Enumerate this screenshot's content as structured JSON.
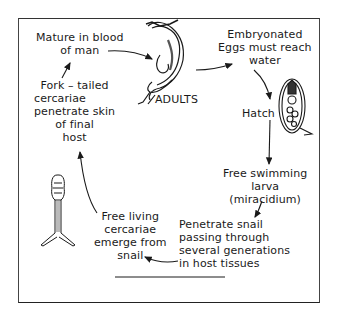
{
  "diagram": {
    "type": "life-cycle",
    "stages": [
      {
        "id": "adults",
        "label": [
          "ADULTS"
        ]
      },
      {
        "id": "mature",
        "label": [
          "Mature in blood",
          "of man"
        ]
      },
      {
        "id": "eggs",
        "label": [
          "Embryonated",
          "Eggs must reach",
          "water"
        ]
      },
      {
        "id": "hatch",
        "label": [
          "Hatch"
        ]
      },
      {
        "id": "miracidium",
        "label": [
          "Free swimming",
          "larva",
          "(miracidium)"
        ]
      },
      {
        "id": "snail",
        "label": [
          "Penetrate snail",
          "passing through",
          "several generations",
          "in host tissues"
        ]
      },
      {
        "id": "cercariae",
        "label": [
          "Free living",
          "cercariae",
          "emerge  from",
          "snail"
        ]
      },
      {
        "id": "fork",
        "label": [
          "Fork – tailed",
          "cercariae",
          "penetrate skin",
          "of  final",
          "host"
        ]
      }
    ],
    "flow": [
      "adults",
      "eggs",
      "hatch",
      "miracidium",
      "snail",
      "cercariae",
      "fork",
      "mature",
      "adults"
    ],
    "illustrations": [
      "adult-worms",
      "egg-embryo",
      "cercaria"
    ],
    "colors": {
      "ink": "#1a1a1a",
      "background": "#ffffff"
    }
  }
}
